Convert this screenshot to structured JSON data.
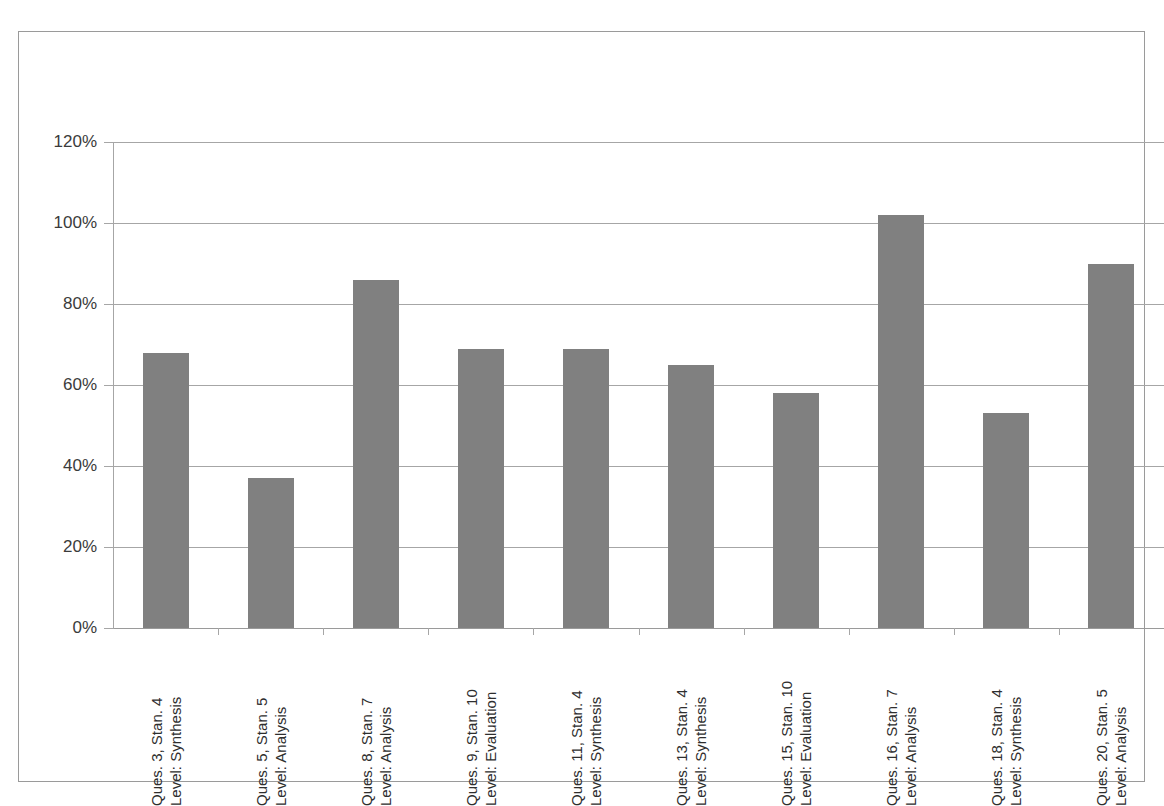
{
  "chart_data": {
    "type": "bar",
    "title": "",
    "subtitle": "",
    "xlabel": "",
    "ylabel": "",
    "ylim": [
      0,
      120
    ],
    "grid": true,
    "legend": false,
    "legend_position": "none",
    "bar_color": "#808080",
    "categories": [
      "Ques. 3, Stan. 4 Level: Synthesis",
      "Ques. 5, Stan. 5 Level: Analysis",
      "Ques. 8, Stan. 7 Level: Analysis",
      "Ques. 9, Stan. 10 Level: Evaluation",
      "Ques. 11, Stan. 4 Level: Synthesis",
      "Ques. 13, Stan. 4 Level: Synthesis",
      "Ques. 15, Stan. 10 Level: Evaluation",
      "Ques. 16, Stan. 7 Level: Analysis",
      "Ques. 18, Stan. 4 Level: Synthesis",
      "Ques. 20, Stan. 5 Level: Analysis"
    ],
    "category_lines": [
      [
        "Ques. 3, Stan. 4",
        "Level: Synthesis"
      ],
      [
        "Ques. 5, Stan. 5",
        "Level: Analysis"
      ],
      [
        "Ques. 8, Stan. 7",
        "Level: Analysis"
      ],
      [
        "Ques. 9, Stan. 10",
        "Level: Evaluation"
      ],
      [
        "Ques. 11, Stan. 4",
        "Level: Synthesis"
      ],
      [
        "Ques. 13, Stan. 4",
        "Level: Synthesis"
      ],
      [
        "Ques. 15, Stan. 10",
        "Level: Evaluation"
      ],
      [
        "Ques. 16, Stan. 7",
        "Level: Analysis"
      ],
      [
        "Ques. 18, Stan. 4",
        "Level: Synthesis"
      ],
      [
        "Ques. 20, Stan. 5",
        "Level: Analysis"
      ]
    ],
    "values": [
      68,
      37,
      86,
      69,
      69,
      65,
      58,
      102,
      53,
      90
    ],
    "ytick_labels": [
      "120%",
      "100%",
      "80%",
      "60%",
      "40%",
      "20%",
      "0%"
    ],
    "ytick_values": [
      120,
      100,
      80,
      60,
      40,
      20,
      0
    ]
  }
}
